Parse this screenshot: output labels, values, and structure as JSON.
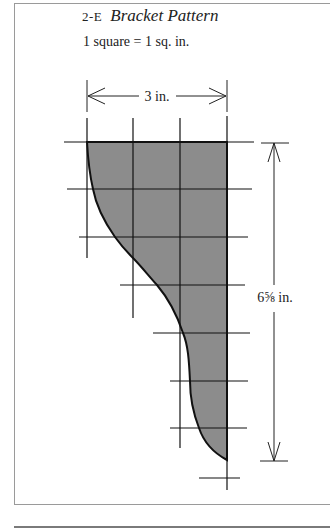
{
  "figure": {
    "number": "2-E",
    "title": "Bracket Pattern",
    "scale_note": "1 square = 1 sq. in.",
    "width_dimension": "3 in.",
    "height_dimension": "6⅝ in.",
    "colors": {
      "fill": "#8c8c8c",
      "line": "#111111",
      "frame": "#9a9a9a"
    }
  }
}
